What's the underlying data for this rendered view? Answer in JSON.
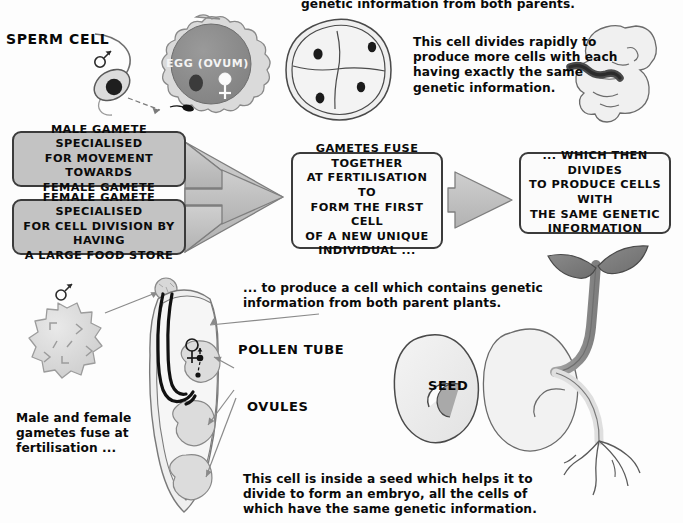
{
  "diagram": {
    "colors": {
      "box_fill_gray": "#c3c3c3",
      "box_fill_white": "#fbfbfb",
      "box_border": "#3b3b3b",
      "arrow_fill": "#bdbdbd",
      "arrow_stroke": "#6f6f6f",
      "egg_cytoplasm": "#8c8c8c",
      "egg_membrane": "#d6d6d6",
      "cell_fill": "#ededed",
      "cell_outline": "#4a4a4a",
      "nucleus": "#1b1b1b",
      "leaf_dark": "#7b7b7b",
      "stem": "#8f8f8f",
      "text": "#0a0a0a"
    }
  },
  "labels": {
    "sperm_cell": "SPERM CELL",
    "egg_ovum": "EGG (OVUM)",
    "pollen_tube": "POLLEN TUBE",
    "ovules": "OVULES",
    "seed": "SEED"
  },
  "notes": {
    "top_cut_line": "genetic information from both parents.",
    "divides_rapidly": "This cell divides rapidly to\nproduce more cells with each\nhaving exactly the same\ngenetic information.",
    "male_female_fuse": "Male and female\ngametes fuse at\nfertilisation ...",
    "both_parent_plants": "... to produce a cell which contains genetic\ninformation from both parent plants.",
    "inside_a_seed": "This cell is inside a seed which helps it to\ndivide to form an embryo, all the cells of\nwhich have the same genetic information."
  },
  "flow": {
    "boxes": [
      {
        "id": "male-gamete",
        "style": "gray",
        "text": "MALE GAMETE SPECIALISED\nFOR MOVEMENT TOWARDS\nFEMALE GAMETE"
      },
      {
        "id": "female-gamete",
        "style": "gray",
        "text": "FEMALE GAMETE SPECIALISED\nFOR CELL DIVISION BY HAVING\nA LARGE FOOD STORE"
      },
      {
        "id": "gametes-fuse",
        "style": "white",
        "text": "GAMETES FUSE TOGETHER\nAT FERTILISATION TO\nFORM THE FIRST CELL\nOF A NEW UNIQUE\nINDIVIDUAL ..."
      },
      {
        "id": "which-then-divides",
        "style": "white",
        "text": "... WHICH THEN DIVIDES\nTO PRODUCE CELLS WITH\nTHE SAME GENETIC\nINFORMATION"
      }
    ]
  },
  "symbols": {
    "male": "♂",
    "female": "♀"
  },
  "illustrations": [
    {
      "name": "sperm-cell-illustration",
      "caption": "SPERM CELL"
    },
    {
      "name": "egg-ovum-illustration",
      "caption": "EGG (OVUM)"
    },
    {
      "name": "four-cell-embryo-illustration",
      "caption": ""
    },
    {
      "name": "fetus-illustration",
      "caption": ""
    },
    {
      "name": "pollen-grain-illustration",
      "caption": ""
    },
    {
      "name": "ovary-pollen-tube-illustration",
      "caption": ""
    },
    {
      "name": "seed-illustration",
      "caption": "SEED"
    },
    {
      "name": "germinating-seedling-illustration",
      "caption": ""
    }
  ]
}
